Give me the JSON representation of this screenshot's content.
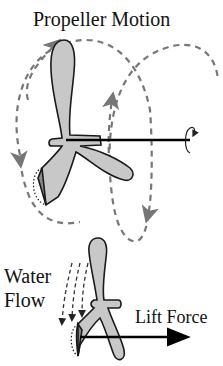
{
  "figure": {
    "title": "Propeller Motion",
    "labels": {
      "water_flow_line1": "Water",
      "water_flow_line2": "Flow",
      "lift_force": "Lift Force"
    }
  },
  "colors": {
    "blade_fill": "#c8c8c8",
    "blade_stroke": "#1a1a1a",
    "path_dashed": "#777777",
    "axis": "#000000",
    "blade_tip_dark": "#8a8a8a"
  },
  "icons": [
    "rotation-arrow-icon",
    "arrow-right-icon",
    "arrow-down-icon"
  ]
}
